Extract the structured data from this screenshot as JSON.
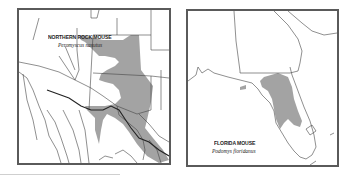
{
  "maps": [
    {
      "id": "northern-rock-mouse",
      "common_name": "NORTHERN ROCK MOUSE",
      "scientific_name": "Peromyscus nasutus",
      "range_color": "#a0a0a0"
    },
    {
      "id": "florida-mouse",
      "common_name": "FLORIDA MOUSE",
      "scientific_name": "Podomys floridanus",
      "range_color": "#a0a0a0"
    }
  ],
  "colors": {
    "frame": "#5a5a5a",
    "borders": "#444444",
    "range": "#a0a0a0"
  }
}
